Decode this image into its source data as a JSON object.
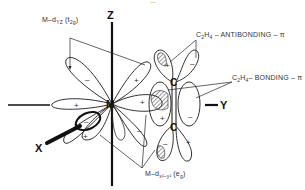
{
  "figure": {
    "top_cutoff_text": "…",
    "axes": {
      "z": "Z",
      "x": "X",
      "y": "Y"
    },
    "atoms": {
      "metal": "M",
      "carbon_top": "C",
      "carbon_bottom": "C"
    },
    "labels": {
      "m_dyz": "M–d",
      "m_dyz_sub": "YZ",
      "m_dyz_sym": "(t",
      "m_dyz_sym_sub": "2g",
      "m_dyz_close": ")",
      "antibonding": "C",
      "antibonding_sub1": "2",
      "antibonding_mid": "H",
      "antibonding_sub2": "4",
      "antibonding_rest": " – ANTIBONDING – π",
      "bonding": "C",
      "bonding_sub1": "2",
      "bonding_mid": "H",
      "bonding_sub2": "4",
      "bonding_rest": "– BONDING – π",
      "m_dx2y2": "M–d",
      "m_dx2y2_sub": "x²–y²",
      "m_dx2y2_sym": "(e",
      "m_dx2y2_sym_sub": "g",
      "m_dx2y2_close": ")"
    },
    "signs": {
      "plus": "+",
      "minus": "–"
    }
  }
}
